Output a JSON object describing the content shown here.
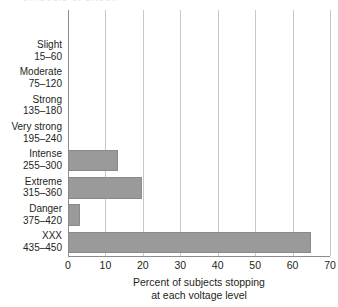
{
  "figure": {
    "top_cut_text": "of levels of shock",
    "bar_color": "#9a9a9a",
    "bar_border_color": "#8a8a8a",
    "gridline_color": "#c9c9c9",
    "axis_color": "#8d8d8d",
    "text_color": "#231f20"
  },
  "chart_data": {
    "type": "bar",
    "orientation": "horizontal",
    "title": "",
    "subtitle": "",
    "xlabel_line1": "Percent of subjects stopping",
    "xlabel_line2": "at each voltage level",
    "ylabel": "",
    "xlim": [
      0,
      70
    ],
    "xticks": [
      0,
      10,
      20,
      30,
      40,
      50,
      60,
      70
    ],
    "xtick_labels": [
      "0",
      "10",
      "20",
      "30",
      "40",
      "50",
      "60",
      "70"
    ],
    "grid": "vertical",
    "legend": "none",
    "categories": [
      "Slight\n15–60",
      "Moderate\n75–120",
      "Strong\n135–180",
      "Very strong\n195–240",
      "Intense\n255–300",
      "Extreme\n315–360",
      "Danger\n375–420",
      "XXX\n435–450"
    ],
    "category_names": [
      "Slight",
      "Moderate",
      "Strong",
      "Very strong",
      "Intense",
      "Extreme",
      "Danger",
      "XXX"
    ],
    "category_ranges": [
      "15–60",
      "75–120",
      "135–180",
      "195–240",
      "255–300",
      "315–360",
      "375–420",
      "435–450"
    ],
    "values": [
      0,
      0,
      0,
      0,
      13.3,
      19.8,
      3.3,
      65.0
    ],
    "rows": [
      {
        "name": "Slight",
        "range": "15–60",
        "value": 0
      },
      {
        "name": "Moderate",
        "range": "75–120",
        "value": 0
      },
      {
        "name": "Strong",
        "range": "135–180",
        "value": 0
      },
      {
        "name": "Very strong",
        "range": "195–240",
        "value": 0
      },
      {
        "name": "Intense",
        "range": "255–300",
        "value": 13.3
      },
      {
        "name": "Extreme",
        "range": "315–360",
        "value": 19.8
      },
      {
        "name": "Danger",
        "range": "375–420",
        "value": 3.3
      },
      {
        "name": "XXX",
        "range": "435–450",
        "value": 65.0
      }
    ]
  }
}
